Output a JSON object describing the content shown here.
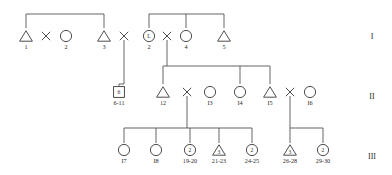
{
  "figure": {
    "kind": "pedigree-chart",
    "width": 392,
    "height": 175,
    "background": "#ffffff",
    "ink_color": "#3a3a3a"
  },
  "generations": [
    {
      "id": "gen-1",
      "numeral": "I",
      "x": 372,
      "y": 36
    },
    {
      "id": "gen-2",
      "numeral": "II",
      "x": 372,
      "y": 96
    },
    {
      "id": "gen-3",
      "numeral": "III",
      "x": 372,
      "y": 156
    }
  ],
  "individuals": [
    {
      "id": "i1",
      "shape": "triangle",
      "label": "1",
      "inner": "",
      "cx": 26,
      "cy": 36,
      "generation": "I"
    },
    {
      "id": "i2a",
      "shape": "circle",
      "label": "2",
      "inner": "",
      "cx": 66,
      "cy": 36,
      "generation": "I"
    },
    {
      "id": "i3",
      "shape": "triangle",
      "label": "3",
      "inner": "",
      "cx": 104,
      "cy": 36,
      "generation": "I"
    },
    {
      "id": "i2b",
      "shape": "circle",
      "label": "2",
      "inner": "L",
      "cx": 149,
      "cy": 36,
      "generation": "I"
    },
    {
      "id": "i4",
      "shape": "circle",
      "label": "4",
      "inner": "",
      "cx": 186,
      "cy": 36,
      "generation": "I"
    },
    {
      "id": "i5",
      "shape": "triangle",
      "label": "5",
      "inner": "",
      "cx": 224,
      "cy": 36,
      "generation": "I"
    },
    {
      "id": "ii6",
      "shape": "square",
      "label": "6-11",
      "inner": "6",
      "cx": 119,
      "cy": 92,
      "generation": "II"
    },
    {
      "id": "ii12",
      "shape": "triangle",
      "label": "12",
      "inner": "",
      "cx": 163,
      "cy": 92,
      "generation": "II"
    },
    {
      "id": "ii13",
      "shape": "circle",
      "label": "I3",
      "inner": "",
      "cx": 210,
      "cy": 92,
      "generation": "II"
    },
    {
      "id": "ii14",
      "shape": "circle",
      "label": "I4",
      "inner": "",
      "cx": 240,
      "cy": 92,
      "generation": "II"
    },
    {
      "id": "ii15",
      "shape": "triangle",
      "label": "I5",
      "inner": "",
      "cx": 270,
      "cy": 92,
      "generation": "II"
    },
    {
      "id": "ii16",
      "shape": "circle",
      "label": "I6",
      "inner": "",
      "cx": 310,
      "cy": 92,
      "generation": "II"
    },
    {
      "id": "iii17",
      "shape": "circle",
      "label": "I7",
      "inner": "",
      "cx": 124,
      "cy": 150,
      "generation": "III"
    },
    {
      "id": "iii18",
      "shape": "circle",
      "label": "I8",
      "inner": "",
      "cx": 156,
      "cy": 150,
      "generation": "III"
    },
    {
      "id": "iii19",
      "shape": "circle",
      "label": "19-20",
      "inner": "2",
      "cx": 190,
      "cy": 150,
      "generation": "III"
    },
    {
      "id": "iii21",
      "shape": "triangle",
      "label": "21-23",
      "inner": "3",
      "cx": 219,
      "cy": 150,
      "generation": "III"
    },
    {
      "id": "iii24",
      "shape": "circle",
      "label": "24-25",
      "inner": "2",
      "cx": 252,
      "cy": 150,
      "generation": "III"
    },
    {
      "id": "iii26",
      "shape": "triangle",
      "label": "26-28",
      "inner": "3",
      "cx": 290,
      "cy": 150,
      "generation": "III"
    },
    {
      "id": "iii29",
      "shape": "circle",
      "label": "29-30",
      "inner": "2",
      "cx": 323,
      "cy": 150,
      "generation": "III"
    }
  ],
  "mating_crosses": [
    {
      "id": "cross-1-2",
      "cx": 46,
      "cy": 36
    },
    {
      "id": "cross-3-2",
      "cx": 124,
      "cy": 36
    },
    {
      "id": "cross-2-4",
      "cx": 167,
      "cy": 36
    },
    {
      "id": "cross-12-13",
      "cx": 187,
      "cy": 92
    },
    {
      "id": "cross-15-16",
      "cx": 290,
      "cy": 92
    }
  ],
  "connectors": {
    "sibship_bar_gen1_left": {
      "x1": 26,
      "x2": 104,
      "y": 14
    },
    "sibship_bar_gen1_right": {
      "x1": 149,
      "x2": 224,
      "y": 14
    },
    "sibship_bar_gen2": {
      "x1": 163,
      "x2": 270,
      "y": 66
    },
    "sibship_bar_gen3_left": {
      "x1": 124,
      "x2": 252,
      "y": 128
    },
    "sibship_bar_gen3_right": {
      "x1": 290,
      "x2": 323,
      "y": 128
    }
  }
}
